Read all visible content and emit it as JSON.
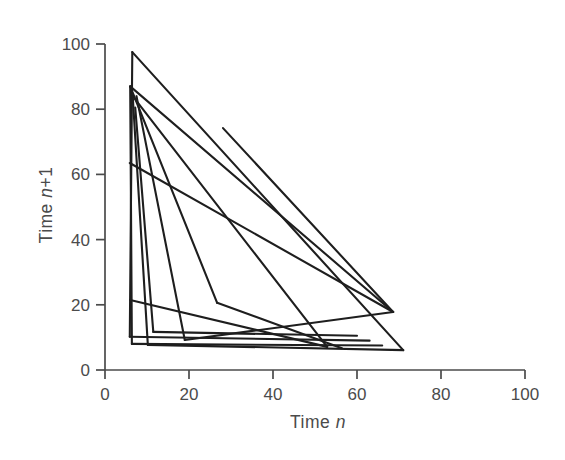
{
  "figure": {
    "background": "#ffffff",
    "data_line_color": "#1e1e1e",
    "axis_color": "#4b4b4b",
    "text_color": "#4b4b4b"
  },
  "chart_data": {
    "type": "line",
    "title": "",
    "xlabel": "Time n",
    "ylabel": "Time n+1",
    "xlabel_parts": {
      "prefix": "Time ",
      "var": "n",
      "suffix": ""
    },
    "ylabel_parts": {
      "prefix": "Time ",
      "var": "n",
      "suffix": "+1"
    },
    "xlim": [
      0,
      100
    ],
    "ylim": [
      0,
      100
    ],
    "x_ticks": [
      0,
      20,
      40,
      60,
      80,
      100
    ],
    "y_ticks": [
      0,
      20,
      40,
      60,
      80,
      100
    ],
    "grid": false,
    "legend": "none",
    "segments": [
      [
        [
          6.5,
          97.5
        ],
        [
          5.9,
          10.2
        ]
      ],
      [
        [
          6.5,
          97.5
        ],
        [
          71.0,
          6.1
        ]
      ],
      [
        [
          6.0,
          87.0
        ],
        [
          6.4,
          8.0
        ]
      ],
      [
        [
          6.0,
          87.0
        ],
        [
          68.6,
          17.8
        ]
      ],
      [
        [
          6.0,
          87.0
        ],
        [
          26.7,
          20.6
        ]
      ],
      [
        [
          6.6,
          84.0
        ],
        [
          52.9,
          7.1
        ]
      ],
      [
        [
          6.6,
          84.0
        ],
        [
          10.2,
          7.7
        ]
      ],
      [
        [
          7.2,
          80.5
        ],
        [
          11.5,
          11.7
        ]
      ],
      [
        [
          7.5,
          84.0
        ],
        [
          19.0,
          9.2
        ]
      ],
      [
        [
          26.7,
          20.6
        ],
        [
          56.4,
          6.7
        ]
      ],
      [
        [
          5.9,
          63.5
        ],
        [
          68.6,
          17.8
        ]
      ],
      [
        [
          6.0,
          21.5
        ],
        [
          52.9,
          7.1
        ]
      ],
      [
        [
          11.5,
          11.7
        ],
        [
          60.0,
          10.5
        ]
      ],
      [
        [
          19.0,
          9.2
        ],
        [
          68.6,
          17.8
        ]
      ],
      [
        [
          5.9,
          10.2
        ],
        [
          63.0,
          9.0
        ]
      ],
      [
        [
          6.4,
          8.0
        ],
        [
          66.0,
          7.5
        ]
      ],
      [
        [
          10.2,
          7.7
        ],
        [
          71.0,
          6.1
        ]
      ],
      [
        [
          28.1,
          74.2
        ],
        [
          68.6,
          17.8
        ]
      ]
    ]
  }
}
